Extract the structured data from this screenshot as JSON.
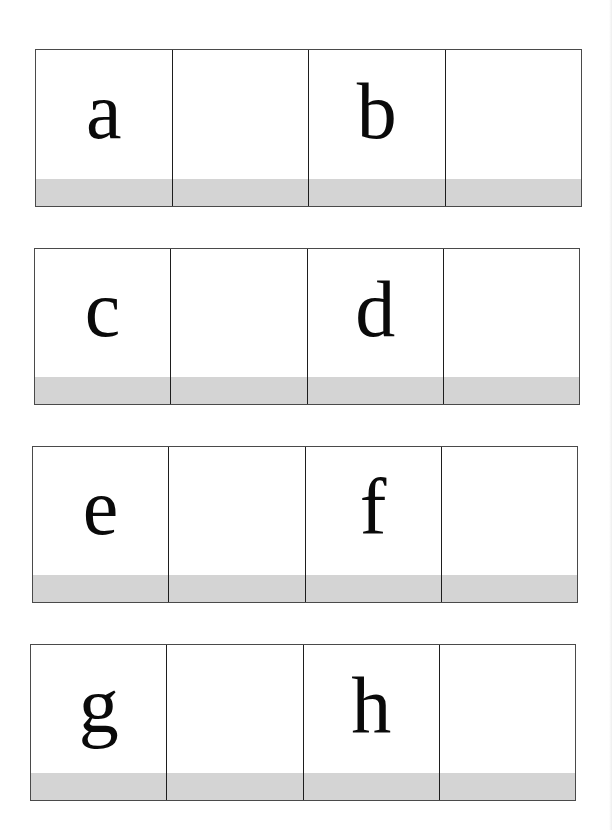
{
  "worksheet": {
    "strips": [
      {
        "cells": [
          {
            "letter": "a"
          },
          {
            "letter": ""
          },
          {
            "letter": "b"
          },
          {
            "letter": ""
          }
        ]
      },
      {
        "cells": [
          {
            "letter": "c"
          },
          {
            "letter": ""
          },
          {
            "letter": "d"
          },
          {
            "letter": ""
          }
        ]
      },
      {
        "cells": [
          {
            "letter": "e"
          },
          {
            "letter": ""
          },
          {
            "letter": "f"
          },
          {
            "letter": ""
          }
        ]
      },
      {
        "cells": [
          {
            "letter": "g"
          },
          {
            "letter": ""
          },
          {
            "letter": "h"
          },
          {
            "letter": ""
          }
        ]
      }
    ]
  },
  "colors": {
    "band": "#d4d4d4",
    "border": "#4a4a4a",
    "divider": "#1e1e1e",
    "text": "#0a0a0a"
  }
}
